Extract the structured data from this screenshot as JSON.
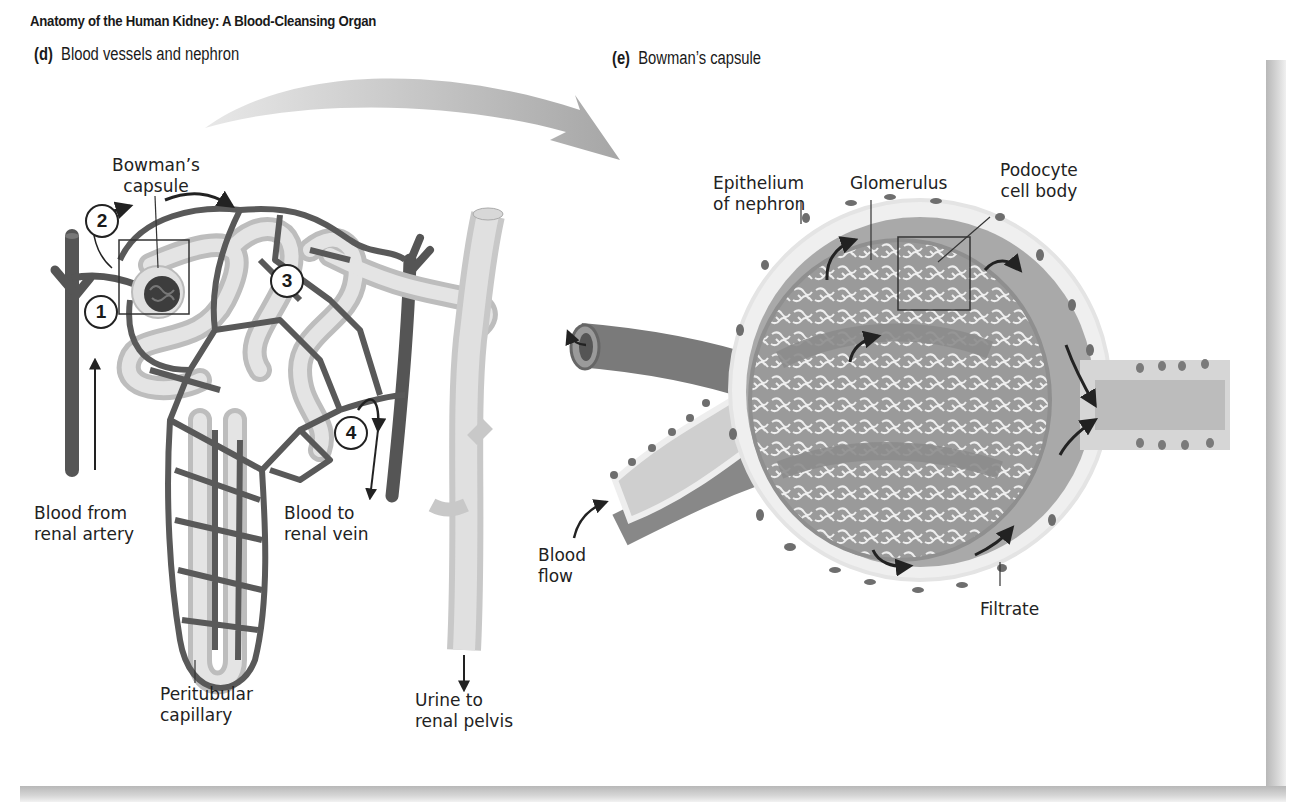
{
  "figure": {
    "title": "Anatomy of the Human Kidney: A Blood-Cleansing Organ"
  },
  "panel_d": {
    "letter": "(d)",
    "heading": "Blood vessels and nephron",
    "labels": {
      "bowmans_capsule_1": "Bowman’s",
      "bowmans_capsule_2": "capsule",
      "blood_from_1": "Blood from",
      "blood_from_2": "renal artery",
      "blood_to_1": "Blood to",
      "blood_to_2": "renal vein",
      "peritubular_1": "Peritubular",
      "peritubular_2": "capillary",
      "urine_1": "Urine to",
      "urine_2": "renal pelvis"
    },
    "steps": [
      "1",
      "2",
      "3",
      "4"
    ]
  },
  "panel_e": {
    "letter": "(e)",
    "heading": "Bowman’s capsule",
    "labels": {
      "epithelium_1": "Epithelium",
      "epithelium_2": "of nephron",
      "glomerulus": "Glomerulus",
      "podocyte_1": "Podocyte",
      "podocyte_2": "cell body",
      "blood_flow_1": "Blood",
      "blood_flow_2": "flow",
      "filtrate": "Filtrate"
    }
  },
  "colors": {
    "vessel": "#5a5a5a",
    "tubule": "#d9d9d9",
    "tubule_edge": "#b5b5b5",
    "capsule": "#a8a8a8",
    "arrow_big": "#bdbdbd"
  }
}
